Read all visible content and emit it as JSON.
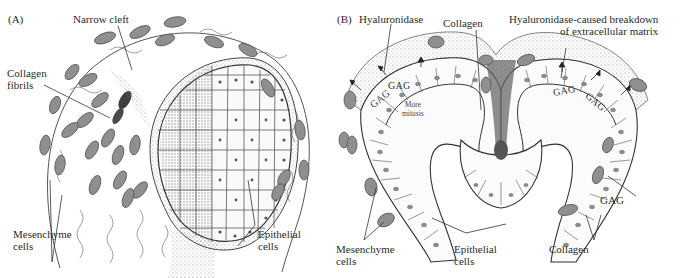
{
  "figure": {
    "panels": [
      {
        "id": "A",
        "tag": "(A)",
        "labels": {
          "narrow_cleft": "Narrow cleft",
          "collagen_fibrils": [
            "Collagen",
            "fibrils"
          ],
          "mesenchyme_cells": [
            "Mesenchyme",
            "cells"
          ],
          "epithelial_cells": [
            "Epithelial",
            "cells"
          ]
        }
      },
      {
        "id": "B",
        "tag": "(B)",
        "labels": {
          "hyaluronidase": "Hyaluronidase",
          "collagen_top": "Collagen",
          "breakdown": [
            "Hyaluronidase-caused breakdown",
            "of extracellular matrix"
          ],
          "gag_left_1": "GAG",
          "gag_left_2": "GAG",
          "gag_right_1": "GAG",
          "gag_right_2": "GAG",
          "more_mitosis": [
            "More",
            "mitosis"
          ],
          "gag_side": "GAG",
          "mesenchyme_cells": [
            "Mesenchyme",
            "cells"
          ],
          "epithelial_cells": [
            "Epithelial",
            "cells"
          ],
          "collagen_bottom": "Collagen"
        }
      }
    ],
    "colors": {
      "ink": "#2b2b2b",
      "mesenchyme_fill": "#8f8f8f",
      "nucleus": "#4a4a4a",
      "stipple": "#9a9a9a",
      "background": "#ffffff"
    }
  }
}
